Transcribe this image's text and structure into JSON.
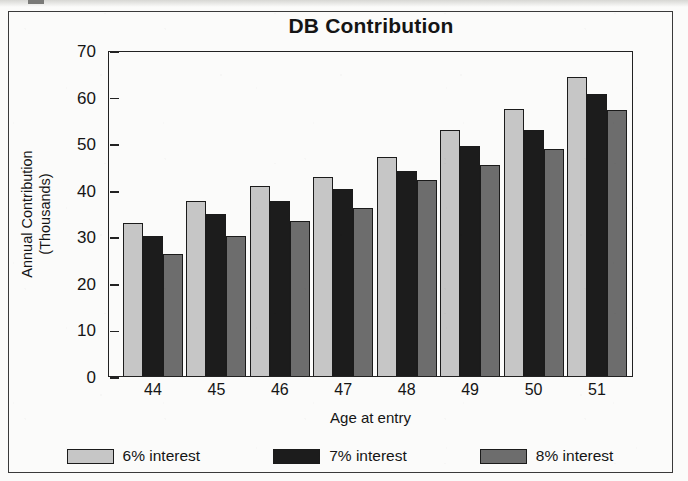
{
  "chart_data": {
    "type": "bar",
    "title": "DB Contribution",
    "xlabel": "Age at entry",
    "ylabel": "Annual Contribution",
    "ylabel_line2": "(Thousands)",
    "categories": [
      "44",
      "45",
      "46",
      "47",
      "48",
      "49",
      "50",
      "51"
    ],
    "ylim": [
      0,
      70
    ],
    "yticks": [
      "0",
      "10",
      "20",
      "30",
      "40",
      "50",
      "60",
      "70"
    ],
    "grid": false,
    "legend_position": "bottom",
    "series": [
      {
        "name": "6% interest",
        "color": "#c6c6c6",
        "values": [
          32.8,
          37.5,
          40.8,
          42.7,
          47.0,
          52.8,
          57.3,
          64.2
        ]
      },
      {
        "name": "7% interest",
        "color": "#1c1c1c",
        "values": [
          30.0,
          34.8,
          37.5,
          40.2,
          44.0,
          49.4,
          52.8,
          60.6
        ]
      },
      {
        "name": "8% interest",
        "color": "#6d6d6d",
        "values": [
          26.3,
          30.0,
          33.3,
          36.0,
          42.0,
          45.4,
          48.8,
          57.2
        ]
      }
    ]
  }
}
